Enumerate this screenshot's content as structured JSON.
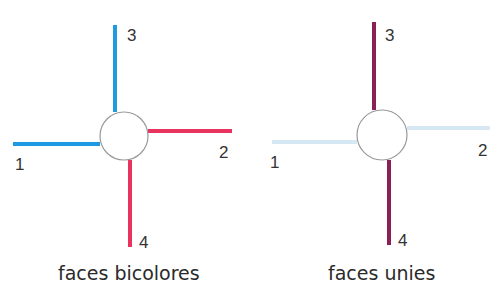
{
  "colors": {
    "blue": "#1e9be0",
    "red": "#e8335f",
    "purple": "#8b1f57",
    "light_blue": "#d6e8f3",
    "circle_stroke": "#999999",
    "text": "#333333"
  },
  "diagrams": [
    {
      "caption": "faces bicolores",
      "labels": {
        "1": "1",
        "2": "2",
        "3": "3",
        "4": "4"
      }
    },
    {
      "caption": "faces unies",
      "labels": {
        "1": "1",
        "2": "2",
        "3": "3",
        "4": "4"
      }
    }
  ]
}
